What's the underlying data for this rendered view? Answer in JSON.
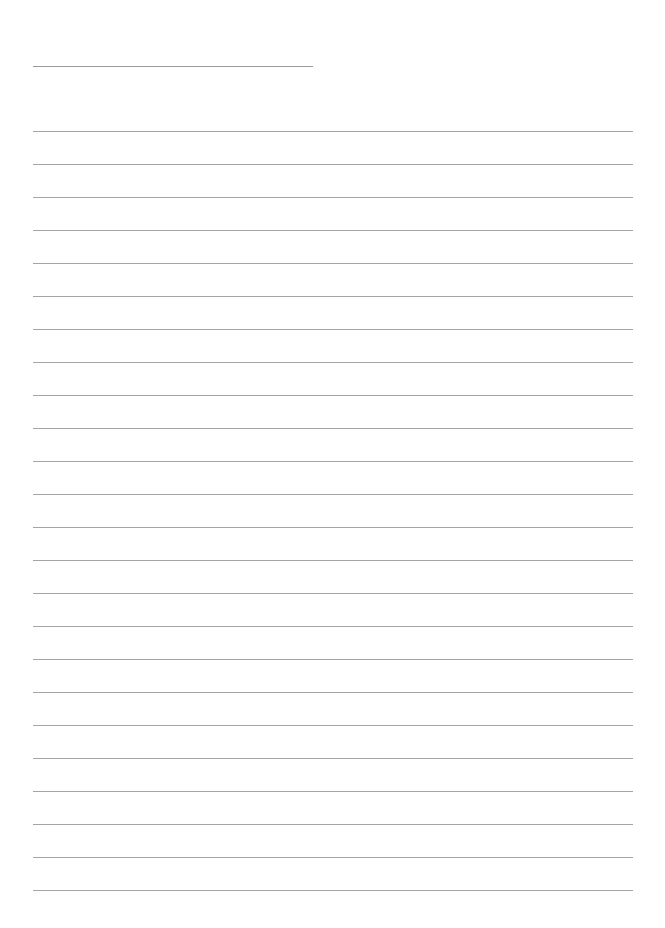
{
  "page": {
    "type": "blank-lined-sheet",
    "header_line": {
      "top": 66,
      "left": 33,
      "width": 280
    },
    "ruled_lines": {
      "count": 24,
      "first_top": 131,
      "spacing": 33,
      "left": 33,
      "width": 600
    },
    "colors": {
      "background": "#ffffff",
      "line": "#a5a5a5"
    }
  }
}
